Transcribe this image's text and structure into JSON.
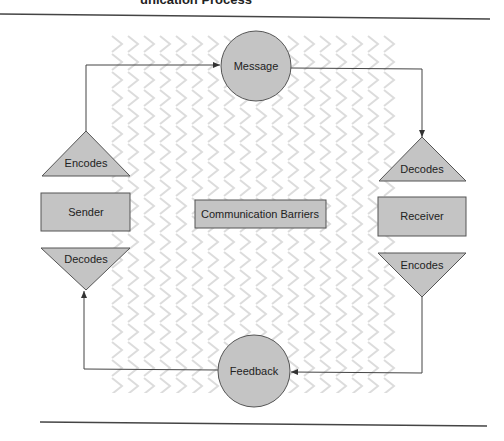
{
  "heading": {
    "partial_text": "unication Process"
  },
  "diagram": {
    "nodes": {
      "message": {
        "label": "Message",
        "shape": "circle"
      },
      "feedback": {
        "label": "Feedback",
        "shape": "circle"
      },
      "sender": {
        "label": "Sender",
        "shape": "rectangle"
      },
      "receiver": {
        "label": "Receiver",
        "shape": "rectangle"
      },
      "sender_encodes": {
        "label": "Encodes",
        "shape": "triangle-up"
      },
      "sender_decodes": {
        "label": "Decodes",
        "shape": "triangle-down"
      },
      "receiver_decodes": {
        "label": "Decodes",
        "shape": "triangle-up"
      },
      "receiver_encodes": {
        "label": "Encodes",
        "shape": "triangle-down"
      },
      "barriers": {
        "label": "Communication Barriers",
        "shape": "rectangle"
      }
    },
    "edges": [
      {
        "from": "sender_encodes",
        "to": "message"
      },
      {
        "from": "message",
        "to": "receiver_decodes"
      },
      {
        "from": "receiver_encodes",
        "to": "feedback"
      },
      {
        "from": "feedback",
        "to": "sender_decodes"
      }
    ],
    "colors": {
      "shape_fill": "#c4c4c4",
      "shape_stroke": "#555555",
      "line": "#444444",
      "barrier_pattern": "#dcdcdc"
    }
  }
}
